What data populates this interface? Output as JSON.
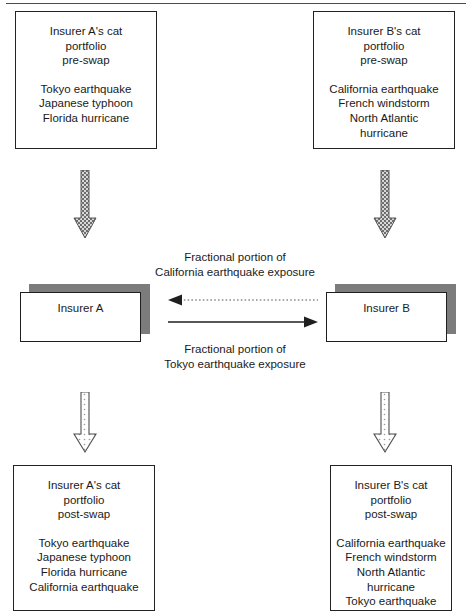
{
  "diagram": {
    "colors": {
      "line": "#222222",
      "shadow": "#7c7c7c",
      "arrow_dark": "#6e6e6e",
      "arrow_light": "#ffffff",
      "text": "#1a1a1a"
    }
  },
  "boxes": {
    "insurer_a_pre": {
      "header": [
        "Insurer A's cat",
        "portfolio",
        "pre-swap"
      ],
      "perils": [
        "Tokyo earthquake",
        "Japanese typhoon",
        "Florida hurricane"
      ]
    },
    "insurer_b_pre": {
      "header": [
        "Insurer B's cat",
        "portfolio",
        "pre-swap"
      ],
      "perils": [
        "California earthquake",
        "French windstorm",
        "North Atlantic",
        "hurricane"
      ]
    },
    "insurer_a_post": {
      "header": [
        "Insurer A's cat",
        "portfolio",
        "post-swap"
      ],
      "perils": [
        "Tokyo earthquake",
        "Japanese typhoon",
        "Florida hurricane",
        "California earthquake"
      ]
    },
    "insurer_b_post": {
      "header": [
        "Insurer B's cat",
        "portfolio",
        "post-swap"
      ],
      "perils": [
        "California earthquake",
        "French windstorm",
        "North Atlantic",
        "hurricane",
        "Tokyo earthquake"
      ]
    }
  },
  "entities": {
    "insurer_a": "Insurer A",
    "insurer_b": "Insurer B"
  },
  "swap_labels": {
    "to_a": [
      "Fractional portion of",
      "California earthquake exposure"
    ],
    "to_b": [
      "Fractional portion of",
      "Tokyo earthquake exposure"
    ]
  },
  "arrows": {
    "ca_exposure": {
      "direction": "left",
      "style": "dotted"
    },
    "tokyo_exposure": {
      "direction": "right",
      "style": "solid"
    },
    "a_pre_to_entity": {
      "direction": "down",
      "style": "filled-hatched"
    },
    "b_pre_to_entity": {
      "direction": "down",
      "style": "filled-hatched"
    },
    "a_entity_to_post": {
      "direction": "down",
      "style": "outlined-dotted"
    },
    "b_entity_to_post": {
      "direction": "down",
      "style": "outlined-dotted"
    }
  }
}
